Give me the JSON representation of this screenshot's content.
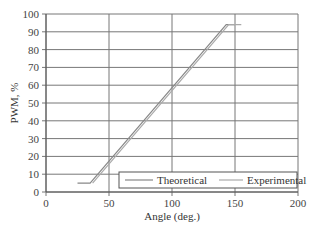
{
  "chart_data": {
    "type": "line",
    "title": "",
    "xlabel": "Angle (deg.)",
    "ylabel": "PWM, %",
    "xlim": [
      0,
      200
    ],
    "ylim": [
      0,
      100
    ],
    "xticks": [
      0,
      50,
      100,
      150,
      200
    ],
    "yticks": [
      0,
      10,
      20,
      30,
      40,
      50,
      60,
      70,
      80,
      90,
      100
    ],
    "grid": true,
    "legend_position": "lower right",
    "series": [
      {
        "name": "Theoretical",
        "x": [
          25,
          35,
          143,
          150
        ],
        "y": [
          5,
          5,
          94,
          94
        ],
        "color": "#888888"
      },
      {
        "name": "Experimental",
        "x": [
          37,
          145,
          155
        ],
        "y": [
          5,
          94,
          94
        ],
        "color": "#aaaaaa"
      }
    ]
  },
  "legend": {
    "items": [
      "Theoretical",
      "Experimental"
    ]
  }
}
